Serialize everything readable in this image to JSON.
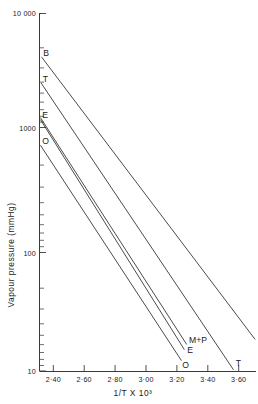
{
  "chart_data": {
    "type": "line",
    "title": "",
    "xlabel": "1/T X 10³",
    "ylabel": "Vapour pressure (mmHg)",
    "yscale": "log",
    "ylim": [
      10,
      10000
    ],
    "xlim": [
      2.3,
      3.72
    ],
    "grid": false,
    "legend_position": "inline-endpoint-labels",
    "ytick_labels": [
      "10 000",
      "1000",
      "100",
      "10"
    ],
    "ytick_values": [
      10000,
      1000,
      100,
      10
    ],
    "xtick_labels": [
      "2·40",
      "2·60",
      "2·80",
      "3·00",
      "3·20",
      "3·40",
      "3·60"
    ],
    "xtick_values": [
      2.4,
      2.6,
      2.8,
      3.0,
      3.2,
      3.4,
      3.6
    ],
    "series": [
      {
        "name": "B",
        "start_label": "B",
        "end_label": "B",
        "x": [
          2.325,
          3.705
        ],
        "y": [
          4300,
          18.5
        ]
      },
      {
        "name": "T",
        "start_label": "T",
        "end_label": "T",
        "x": [
          2.322,
          3.565
        ],
        "y": [
          2600,
          10.3
        ]
      },
      {
        "name": "M+P",
        "start_label": "",
        "end_label": "M+P",
        "x": [
          2.318,
          3.262
        ],
        "y": [
          1330,
          16.8
        ]
      },
      {
        "name": "E",
        "start_label": "E",
        "end_label": "E",
        "x": [
          2.318,
          3.247
        ],
        "y": [
          1280,
          15.2
        ]
      },
      {
        "name": "O",
        "start_label": "O",
        "end_label": "O",
        "x": [
          2.318,
          3.228
        ],
        "y": [
          780,
          12.3
        ]
      }
    ]
  }
}
